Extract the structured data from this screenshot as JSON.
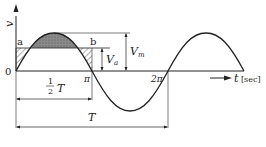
{
  "diagram": {
    "y_axis_label": "v",
    "x_axis_label": "t",
    "x_unit": "[sec]",
    "origin": "0",
    "pi": "π",
    "two_pi": "2π",
    "point_a": "a",
    "point_b": "b",
    "va": "V",
    "va_sub": "a",
    "vm": "V",
    "vm_sub": "m",
    "half_num": "1",
    "half_den": "2",
    "half_T": "T",
    "period_T": "T"
  }
}
